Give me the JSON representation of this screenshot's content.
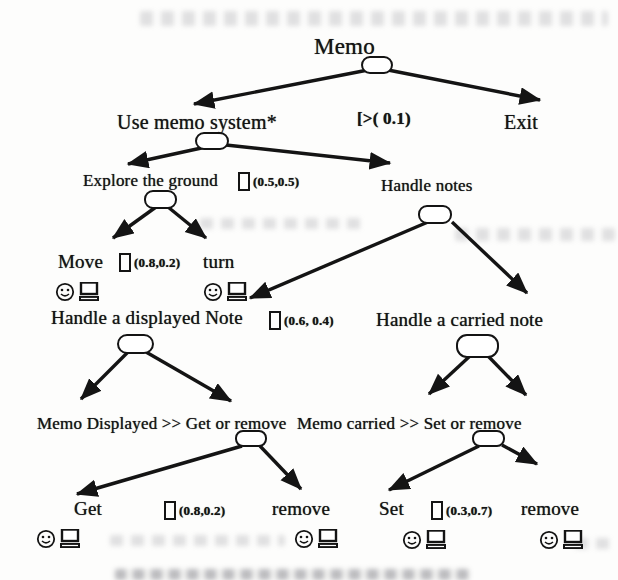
{
  "figure_type": "task-tree-diagram",
  "colors": {
    "paper": "#fdfdfc",
    "ink": "#141414",
    "node_fill": "#ffffff"
  },
  "tree": {
    "root": "Memo",
    "l1_left": "Use memo system*",
    "l1_operator": "[>( 0.1)",
    "l1_right": "Exit",
    "l2_left": "Explore the ground",
    "l2_left_prob": "(0.5,0.5)",
    "l2_right": "Handle notes",
    "l3_move": "Move",
    "l3_move_prob": "(0.8,0.2)",
    "l3_turn": "turn",
    "l4_displayed": "Handle a displayed Note",
    "l4_prob": "(0.6, 0.4)",
    "l4_carried": "Handle a carried note",
    "l5_displayed": "Memo Displayed >>  Get or remove",
    "l5_carried": "Memo carried >> Set or remove",
    "l6_get": "Get",
    "l6_get_prob": "(0.8,0.2)",
    "l6_remove_left": "remove",
    "l6_set": "Set",
    "l6_set_prob": "(0.3,0.7)",
    "l6_remove_right": "remove"
  },
  "icons": {
    "smiley-face-icon": "circle face with eyes and smile (☺)",
    "computer-icon": "monitor with keyboard base",
    "choice-box-icon": "empty square brackets box []"
  }
}
